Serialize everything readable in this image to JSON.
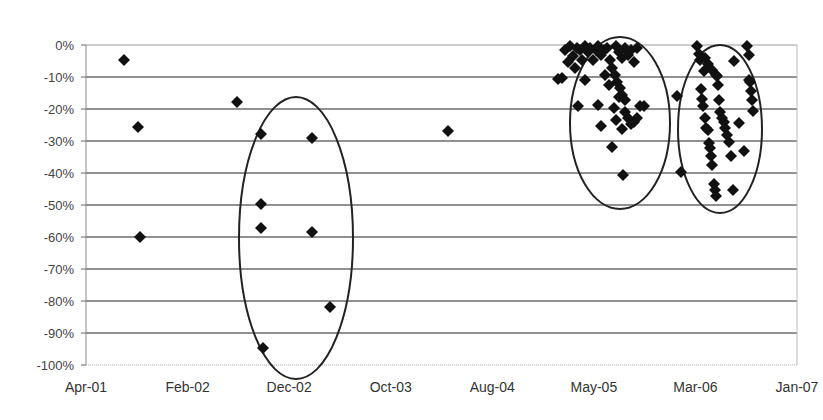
{
  "chart_data": {
    "type": "scatter",
    "title": "",
    "xlabel": "",
    "ylabel": "",
    "x_tick_labels": [
      "Apr-01",
      "Feb-02",
      "Dec-02",
      "Oct-03",
      "Aug-04",
      "May-05",
      "Mar-06",
      "Jan-07"
    ],
    "y_tick_labels": [
      "0%",
      "-10%",
      "-20%",
      "-30%",
      "-40%",
      "-50%",
      "-60%",
      "-70%",
      "-80%",
      "-90%",
      "-100%"
    ],
    "ylim": [
      -100,
      0
    ],
    "xlim": [
      "Apr-01",
      "Jan-07"
    ],
    "grid": "horizontal",
    "legend": "none",
    "marker": "diamond",
    "annotations": [
      "ellipse around Dec-02 cluster",
      "ellipse around Nov-05 cluster",
      "ellipse around Jul-06 cluster"
    ],
    "ellipses": [
      {
        "cx": 296,
        "cy": 238,
        "rx": 57,
        "ry": 141
      },
      {
        "cx": 620,
        "cy": 123,
        "rx": 50,
        "ry": 86
      },
      {
        "cx": 720,
        "cy": 129,
        "rx": 42,
        "ry": 84
      }
    ],
    "points_px": [
      [
        124,
        60
      ],
      [
        138,
        127
      ],
      [
        140,
        237
      ],
      [
        237,
        102
      ],
      [
        261,
        134
      ],
      [
        261,
        204
      ],
      [
        261,
        228
      ],
      [
        263,
        348
      ],
      [
        312,
        138
      ],
      [
        312,
        232
      ],
      [
        330,
        307
      ],
      [
        448,
        131
      ],
      [
        562,
        78
      ],
      [
        565,
        50
      ],
      [
        568,
        62
      ],
      [
        570,
        46
      ],
      [
        573,
        56
      ],
      [
        575,
        68
      ],
      [
        577,
        48
      ],
      [
        580,
        50
      ],
      [
        582,
        60
      ],
      [
        585,
        46
      ],
      [
        588,
        52
      ],
      [
        590,
        48
      ],
      [
        593,
        60
      ],
      [
        596,
        50
      ],
      [
        598,
        46
      ],
      [
        601,
        55
      ],
      [
        604,
        50
      ],
      [
        607,
        48
      ],
      [
        610,
        60
      ],
      [
        612,
        68
      ],
      [
        615,
        75
      ],
      [
        617,
        82
      ],
      [
        620,
        88
      ],
      [
        622,
        95
      ],
      [
        625,
        100
      ],
      [
        616,
        46
      ],
      [
        619,
        52
      ],
      [
        622,
        58
      ],
      [
        625,
        48
      ],
      [
        628,
        55
      ],
      [
        631,
        50
      ],
      [
        634,
        62
      ],
      [
        637,
        48
      ],
      [
        598,
        105
      ],
      [
        601,
        126
      ],
      [
        605,
        75
      ],
      [
        609,
        85
      ],
      [
        612,
        147
      ],
      [
        614,
        108
      ],
      [
        616,
        120
      ],
      [
        619,
        97
      ],
      [
        622,
        129
      ],
      [
        625,
        112
      ],
      [
        628,
        118
      ],
      [
        631,
        124
      ],
      [
        634,
        122
      ],
      [
        637,
        118
      ],
      [
        640,
        106
      ],
      [
        644,
        106
      ],
      [
        623,
        175
      ],
      [
        585,
        80
      ],
      [
        578,
        106
      ],
      [
        558,
        79
      ],
      [
        677,
        96
      ],
      [
        681,
        172
      ],
      [
        697,
        46
      ],
      [
        699,
        54
      ],
      [
        700,
        60
      ],
      [
        701,
        89
      ],
      [
        702,
        99
      ],
      [
        703,
        106
      ],
      [
        704,
        71
      ],
      [
        705,
        118
      ],
      [
        706,
        128
      ],
      [
        708,
        130
      ],
      [
        709,
        143
      ],
      [
        710,
        148
      ],
      [
        711,
        156
      ],
      [
        712,
        165
      ],
      [
        714,
        184
      ],
      [
        715,
        190
      ],
      [
        716,
        196
      ],
      [
        717,
        76
      ],
      [
        718,
        85
      ],
      [
        719,
        100
      ],
      [
        720,
        112
      ],
      [
        722,
        118
      ],
      [
        724,
        122
      ],
      [
        725,
        128
      ],
      [
        727,
        135
      ],
      [
        729,
        142
      ],
      [
        731,
        156
      ],
      [
        705,
        58
      ],
      [
        708,
        64
      ],
      [
        712,
        70
      ],
      [
        716,
        75
      ],
      [
        733,
        190
      ],
      [
        734,
        61
      ],
      [
        739,
        123
      ],
      [
        744,
        151
      ],
      [
        747,
        46
      ],
      [
        749,
        55
      ],
      [
        749,
        80
      ],
      [
        751,
        91
      ],
      [
        752,
        100
      ],
      [
        753,
        111
      ],
      [
        750,
        82
      ]
    ],
    "approx_values": [
      {
        "date": "Aug-01",
        "drawdown": -5
      },
      {
        "date": "Oct-01",
        "drawdown": -26
      },
      {
        "date": "Oct-01",
        "drawdown": -60
      },
      {
        "date": "Aug-02",
        "drawdown": -18
      },
      {
        "date": "Nov-02",
        "drawdown": -28
      },
      {
        "date": "Nov-02",
        "drawdown": -50
      },
      {
        "date": "Nov-02",
        "drawdown": -57
      },
      {
        "date": "Nov-02",
        "drawdown": -95
      },
      {
        "date": "Apr-03",
        "drawdown": -29
      },
      {
        "date": "Apr-03",
        "drawdown": -59
      },
      {
        "date": "Jun-03",
        "drawdown": -82
      },
      {
        "date": "Apr-04",
        "drawdown": -27
      },
      {
        "date": "Oct-05",
        "drawdown": -41
      },
      {
        "date": "Jul-06",
        "drawdown": -47
      }
    ]
  },
  "axes": {
    "y_labels": [
      "0%",
      "-10%",
      "-20%",
      "-30%",
      "-40%",
      "-50%",
      "-60%",
      "-70%",
      "-80%",
      "-90%",
      "-100%"
    ],
    "x_labels": [
      "Apr-01",
      "Feb-02",
      "Dec-02",
      "Oct-03",
      "Aug-04",
      "May-05",
      "Mar-06",
      "Jan-07"
    ]
  }
}
